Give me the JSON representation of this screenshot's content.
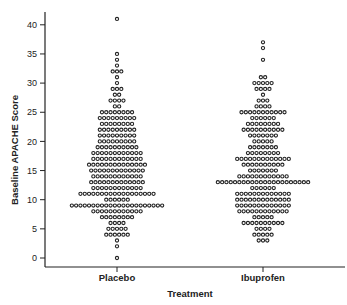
{
  "chart_data": {
    "type": "scatter",
    "subtype": "dot-plot",
    "title": "",
    "xlabel": "Treatment",
    "ylabel": "Baseline APACHE Score",
    "ylim": [
      0,
      42
    ],
    "yticks": [
      0,
      5,
      10,
      15,
      20,
      25,
      30,
      35,
      40
    ],
    "categories": [
      "Placebo",
      "Ibuprofen"
    ],
    "grid": false,
    "legend": null,
    "series": [
      {
        "name": "Placebo",
        "counts_by_score": {
          "0": 1,
          "2": 1,
          "3": 1,
          "4": 6,
          "5": 5,
          "6": 4,
          "7": 8,
          "8": 12,
          "9": 22,
          "10": 6,
          "11": 18,
          "12": 12,
          "13": 13,
          "14": 12,
          "15": 13,
          "16": 14,
          "17": 12,
          "18": 12,
          "19": 10,
          "20": 9,
          "21": 9,
          "22": 9,
          "23": 8,
          "24": 9,
          "25": 8,
          "26": 2,
          "27": 4,
          "28": 2,
          "29": 3,
          "30": 1,
          "31": 1,
          "32": 3,
          "33": 1,
          "34": 1,
          "35": 1,
          "41": 1
        }
      },
      {
        "name": "Ibuprofen",
        "counts_by_score": {
          "3": 3,
          "4": 5,
          "5": 4,
          "6": 10,
          "7": 5,
          "8": 12,
          "9": 13,
          "10": 13,
          "11": 13,
          "12": 6,
          "13": 22,
          "14": 12,
          "15": 7,
          "16": 10,
          "17": 13,
          "18": 8,
          "19": 7,
          "20": 5,
          "21": 7,
          "22": 10,
          "23": 8,
          "24": 6,
          "25": 11,
          "26": 4,
          "27": 3,
          "28": 1,
          "29": 4,
          "30": 5,
          "31": 2,
          "34": 1,
          "36": 1,
          "37": 1
        }
      }
    ]
  },
  "colors": {
    "axis": "#222222",
    "dot_stroke": "#222222",
    "dot_fill": "#ffffff",
    "background": "#ffffff"
  }
}
